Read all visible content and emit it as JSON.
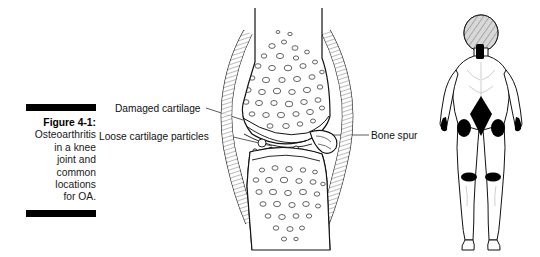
{
  "figure": {
    "caption": {
      "title": "Figure 4-1:",
      "lines": [
        "Osteoarthritis",
        "in a knee",
        "joint and",
        "common",
        "locations",
        "for OA."
      ],
      "full_text": "Figure 4-1: Osteoarthritis in a knee joint and common locations for OA."
    },
    "rules": {
      "top": "caption-rule-top",
      "bottom": "caption-rule-bottom"
    }
  },
  "labels": {
    "damaged_cartilage": "Damaged cartilage",
    "loose_cartilage_particles": "Loose cartilage particles",
    "bone_spur": "Bone spur"
  },
  "illustrations": {
    "knee": {
      "name": "knee-joint-cross-section",
      "parts": [
        "femur",
        "tibia",
        "joint-capsule",
        "articular-cartilage",
        "trabecular-bone",
        "loose-particles",
        "bone-spur"
      ]
    },
    "body": {
      "name": "posterior-body-figure",
      "oa_marker_locations": [
        "neck",
        "lower-back",
        "left-hip",
        "right-hip",
        "left-knee",
        "right-knee",
        "left-hand",
        "right-hand"
      ]
    }
  },
  "colors": {
    "ink": "#000000",
    "background": "#ffffff",
    "marker": "#000000",
    "hair_shade": "#9a9a9a",
    "line_light": "#555555"
  }
}
